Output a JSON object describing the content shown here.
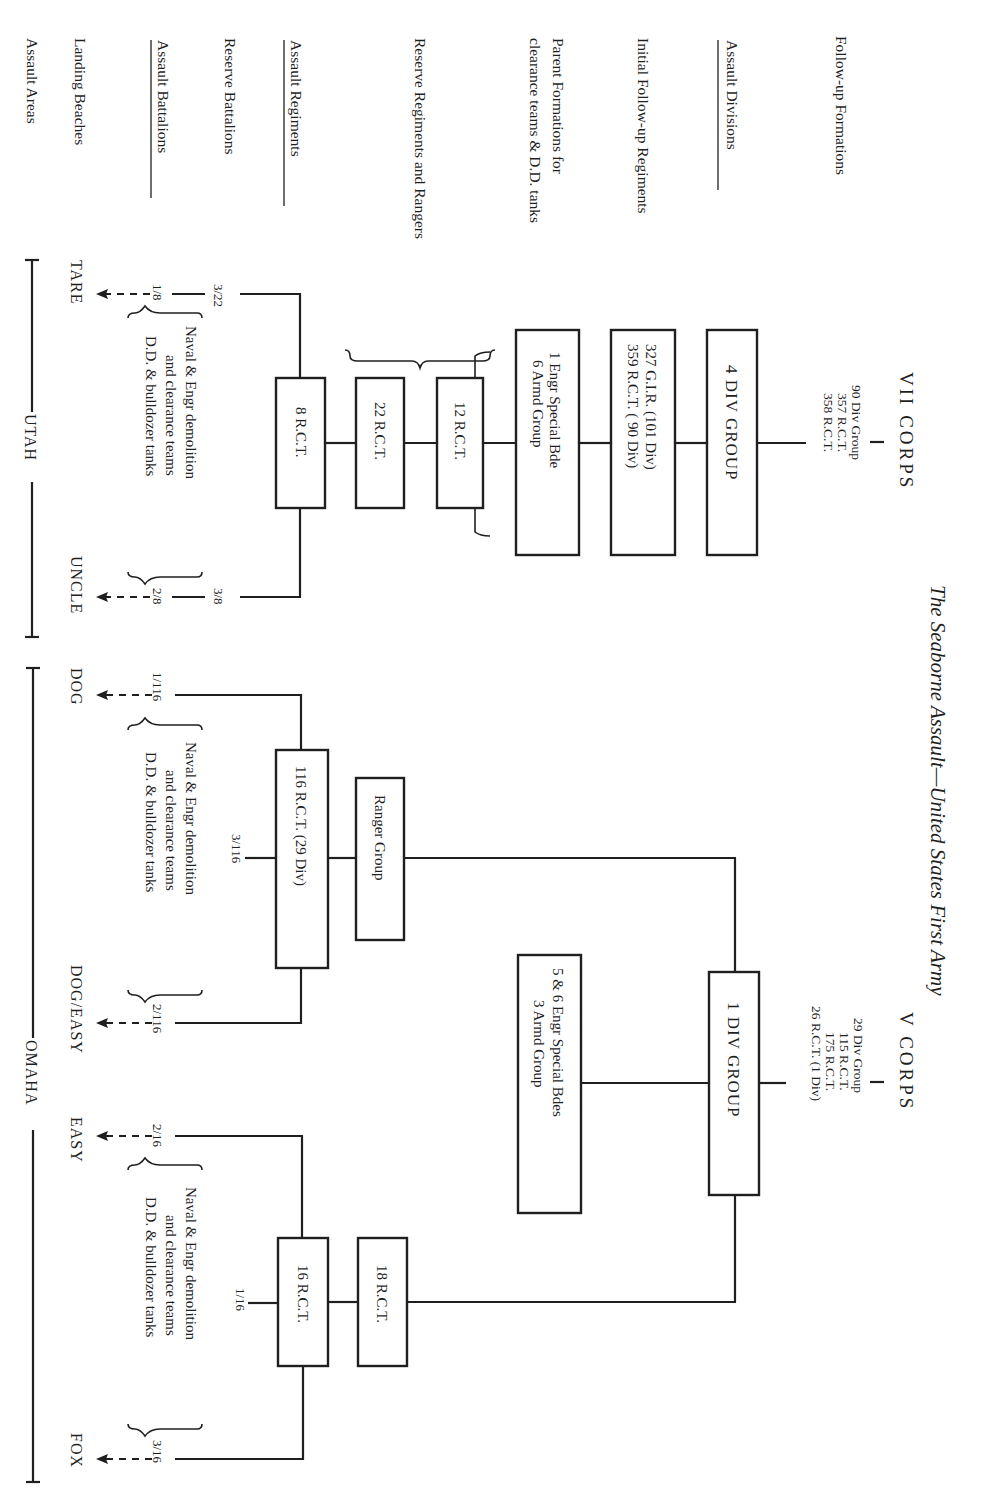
{
  "title": "The Seaborne Assault—United States First Army",
  "orientation": "rotated 90° clockwise; text reads top-to-bottom",
  "row_labels": [
    {
      "id": "follow-up-formations",
      "text": "Follow-up Formations",
      "underlined": false
    },
    {
      "id": "assault-divisions",
      "text": "Assault Divisions",
      "underlined": true
    },
    {
      "id": "initial-follow-up-regiments",
      "text": "Initial Follow-up Regiments",
      "underlined": false
    },
    {
      "id": "parent-formations",
      "text": "Parent Formations for",
      "text2": "clearance teams & D.D. tanks",
      "underlined": false
    },
    {
      "id": "reserve-regiments-rangers",
      "text": "Reserve Regiments and Rangers",
      "underlined": false
    },
    {
      "id": "assault-regiments",
      "text": "Assault Regiments",
      "underlined": true
    },
    {
      "id": "reserve-battalions",
      "text": "Reserve Battalions",
      "underlined": false
    },
    {
      "id": "assault-battalions",
      "text": "Assault Battalions",
      "underlined": true
    },
    {
      "id": "landing-beaches",
      "text": "Landing Beaches",
      "underlined": false
    },
    {
      "id": "assault-areas",
      "text": "Assault Areas",
      "underlined": false
    }
  ],
  "vii_corps": {
    "name": "VII CORPS",
    "follow_up": [
      "90 Div Group",
      "357 R.C.T.",
      "358 R.C.T."
    ],
    "assault_division": "4 DIV GROUP",
    "initial_follow_up": [
      "327 G.I.R. (101 Div)",
      "359 R.C.T. ( 90 Div)"
    ],
    "parent_formations": [
      "1 Engr Special Bde",
      "6 Armd Group"
    ],
    "reserve_regiments": [
      "12 R.C.T.",
      "22 R.C.T."
    ],
    "assault_regiment": "8 R.C.T.",
    "reserve_battalion": "3/22",
    "assault_battalions": [
      "1/8",
      "2/8"
    ],
    "reserve_battalion_2": "3/8",
    "clearance_note": [
      "Naval & Engr demolition",
      "and clearance teams",
      "D.D. & bulldozer tanks"
    ],
    "beaches": [
      "TARE",
      "UNCLE"
    ],
    "area": "UTAH"
  },
  "v_corps": {
    "name": "V CORPS",
    "follow_up": [
      "29 Div Group",
      "115 R.C.T.",
      "175 R.C.T.",
      "26 R.C.T. (1 Div)"
    ],
    "assault_division": "1 DIV GROUP",
    "parent_formations": [
      "5 & 6 Engr Special Bdes",
      "3 Armd Group"
    ],
    "rangers": "Ranger Group",
    "reserve_regiment": "18 R.C.T.",
    "assault_regiments": [
      "116 R.C.T. (29 Div)",
      "16 R.C.T."
    ],
    "reserve_battalions": [
      "3/116",
      "1/16"
    ],
    "assault_battalions": [
      "1/116",
      "2/116",
      "2/16",
      "3/16"
    ],
    "clearance_note": [
      "Naval & Engr demolition",
      "and clearance teams",
      "D.D. & bulldozer tanks"
    ],
    "beaches": [
      "DOG",
      "DOG/EASY",
      "EASY",
      "FOX"
    ],
    "area": "OMAHA"
  }
}
